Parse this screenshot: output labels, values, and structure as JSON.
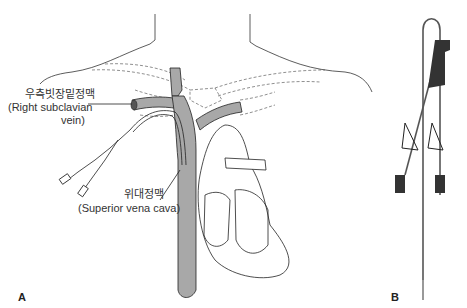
{
  "figure": {
    "panels": [
      {
        "id": "A",
        "label": "A",
        "description": "Anatomical illustration of central venous catheter inserted via right subclavian vein into superior vena cava near heart"
      },
      {
        "id": "B",
        "label": "B",
        "description": "Double-lumen central venous catheter with clamps and luer connectors"
      }
    ],
    "annotations": {
      "subclavian": {
        "korean": "우측빗장밑정맥",
        "english_line1": "(Right subclavian",
        "english_line2": "vein)"
      },
      "svc": {
        "korean": "위대정맥",
        "english": "(Superior vena cava)"
      }
    }
  },
  "colors": {
    "vessel_fill": "#a8a8a8",
    "line": "#222222",
    "catheter_dark": "#333333"
  }
}
